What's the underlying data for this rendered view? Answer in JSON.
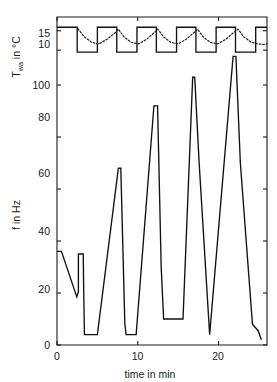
{
  "chart_data": {
    "type": "line",
    "title": "",
    "xlabel": "time in min",
    "xlim": [
      0,
      26
    ],
    "xticks": [
      0,
      10,
      20
    ],
    "xticklabels": [
      "0",
      "10",
      "20"
    ],
    "panels": [
      {
        "name": "water-temperature",
        "ylabel_main": "T",
        "ylabel_sub": "wa",
        "ylabel_unit": " in °C",
        "ylabel_full": "T_wa in °C",
        "ylim": [
          8.5,
          17.5
        ],
        "yticks": [
          10,
          15
        ],
        "yticklabels": [
          "10",
          "15"
        ],
        "series": [
          {
            "name": "T_wa setpoint (square wave)",
            "style": "solid",
            "x": [
              0,
              2.5,
              2.5,
              5.0,
              5.0,
              7.4,
              7.4,
              9.9,
              9.9,
              12.3,
              12.3,
              14.8,
              14.8,
              17.2,
              17.2,
              19.7,
              19.7,
              22.1,
              22.1,
              24.6,
              24.6,
              26.0
            ],
            "y": [
              15.9,
              15.9,
              9.5,
              9.5,
              15.9,
              15.9,
              9.5,
              9.5,
              15.9,
              15.9,
              9.5,
              9.5,
              15.9,
              15.9,
              9.5,
              9.5,
              15.9,
              15.9,
              9.5,
              9.5,
              15.9,
              15.9
            ]
          },
          {
            "name": "T_wa measured (dotted)",
            "style": "dotted",
            "x": [
              2.6,
              3.4,
              4.3,
              5.2,
              6.2,
              7.2,
              7.6,
              8.3,
              9.2,
              10.1,
              11.1,
              12.1,
              12.5,
              13.2,
              14.1,
              15.0,
              16.0,
              17.0,
              17.4,
              18.1,
              19.0,
              19.9,
              20.9,
              21.9,
              22.4,
              23.1,
              24.0,
              24.9,
              25.6,
              26.0
            ],
            "y": [
              15.5,
              13.4,
              12.0,
              11.6,
              12.8,
              14.5,
              15.4,
              13.4,
              12.0,
              11.6,
              12.8,
              14.6,
              15.4,
              13.4,
              12.0,
              11.6,
              12.8,
              14.6,
              15.4,
              13.4,
              12.0,
              11.6,
              12.8,
              14.6,
              15.4,
              13.5,
              12.1,
              11.6,
              11.5,
              11.6
            ]
          }
        ]
      },
      {
        "name": "frequency",
        "ylabel_full": "f in Hz",
        "ylim": [
          0,
          120
        ],
        "yticks": [
          0,
          20,
          40,
          60,
          80,
          100
        ],
        "yticklabels": [
          "0",
          "20",
          "40",
          "60",
          "80",
          "100"
        ],
        "series": [
          {
            "name": "f",
            "style": "solid",
            "x": [
              0.0,
              0.55,
              2.45,
              2.65,
              2.65,
              3.25,
              3.3,
              3.4,
              4.15,
              5.0,
              7.6,
              7.9,
              8.4,
              8.55,
              9.8,
              12.0,
              12.45,
              12.9,
              13.2,
              15.6,
              16.8,
              17.05,
              17.6,
              18.9,
              21.8,
              22.15,
              22.7,
              24.2,
              24.9,
              25.3
            ],
            "y": [
              36.0,
              36.0,
              18.5,
              20.5,
              35.0,
              35.0,
              22.0,
              4.0,
              4.0,
              4.0,
              68.0,
              68.0,
              8.0,
              4.0,
              4.0,
              92.0,
              92.0,
              30.0,
              10.0,
              10.0,
              103.0,
              103.0,
              70.0,
              4.0,
              111.0,
              111.0,
              70.0,
              8.0,
              5.5,
              2.0
            ]
          }
        ]
      }
    ]
  },
  "labels": {
    "x_axis": "time in min",
    "y_axis_top_main": "T",
    "y_axis_top_sub": "wa",
    "y_axis_top_rest": " in °C",
    "y_axis_bottom": "f in Hz",
    "xtick_0": "0",
    "xtick_1": "10",
    "xtick_2": "20",
    "ytick_t_10": "10",
    "ytick_t_15": "15",
    "ytick_f_0": "0",
    "ytick_f_20": "20",
    "ytick_f_40": "40",
    "ytick_f_60": "60",
    "ytick_f_80": "80",
    "ytick_f_100": "100"
  },
  "colors": {
    "line": "#111111",
    "axis": "#1a1a1a",
    "background": "#ffffff"
  }
}
